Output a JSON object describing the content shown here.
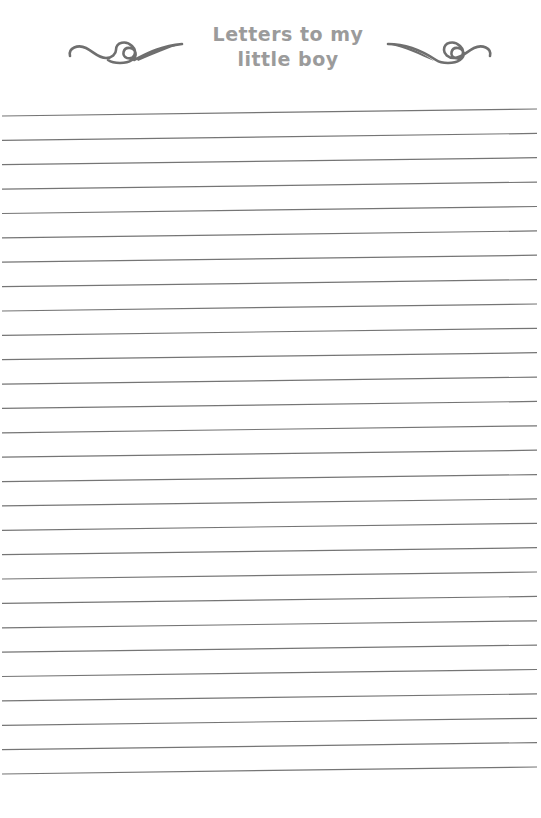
{
  "header": {
    "title_line_1": "Letters to my",
    "title_line_2": "little boy",
    "title_color": "#9b9b9b",
    "ornament_left": "swirl-flourish-icon",
    "ornament_right": "swirl-flourish-icon",
    "ornament_color": "#6f6f6f"
  },
  "page": {
    "ruled_line_count": 28,
    "line_color": "#757575",
    "first_line_y_left": 116,
    "first_line_y_right": 109,
    "line_spacing": 24.37
  }
}
